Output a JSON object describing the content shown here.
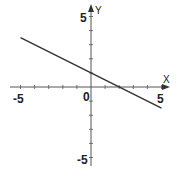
{
  "chart_data": {
    "type": "line",
    "title": "",
    "xlabel": "X",
    "ylabel": "Y",
    "xlim": [
      -5,
      5
    ],
    "ylim": [
      -5,
      5
    ],
    "grid": false,
    "x_tick_labels": [
      "-5",
      "0",
      "5"
    ],
    "y_tick_labels": [
      "5",
      "-5"
    ],
    "series": [
      {
        "name": "line",
        "x": [
          -5,
          5
        ],
        "y": [
          3.5,
          -1.5
        ]
      }
    ],
    "equation": "y = -0.5x + 1.5",
    "colors": {
      "axis": "#555555",
      "line": "#333333"
    }
  },
  "labels": {
    "x_axis": "X",
    "y_axis": "Y",
    "x_neg": "-5",
    "x_pos": "5",
    "origin": "0",
    "y_pos": "5",
    "y_neg": "-5"
  }
}
